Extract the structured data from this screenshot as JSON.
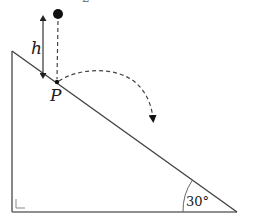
{
  "diagram": {
    "type": "physics-incline-projectile",
    "labels": {
      "height": "h",
      "point": "P",
      "angle": "30°",
      "top_fragment": "2"
    },
    "incline": {
      "angle_deg": 30,
      "vertices": {
        "top_left": [
          12,
          51
        ],
        "bottom_left": [
          12,
          212
        ],
        "bottom_right": [
          237,
          212
        ]
      },
      "right_angle_marker": "bottom-left"
    },
    "ball": {
      "center": [
        58,
        14
      ],
      "radius": 5,
      "color": "#111111"
    },
    "drop_path": {
      "style": "dashed",
      "from": [
        58,
        20
      ],
      "to": [
        57,
        80
      ]
    },
    "height_arrow": {
      "style": "double-headed",
      "x": 43,
      "y_top": 15,
      "y_bottom": 78
    },
    "trajectory": {
      "style": "dashed",
      "from": [
        57,
        82
      ],
      "to": [
        153,
        124
      ],
      "arrowhead": true
    },
    "colors": {
      "line": "#555555",
      "ink": "#111111",
      "dash": "#444444",
      "background": "#ffffff"
    }
  }
}
